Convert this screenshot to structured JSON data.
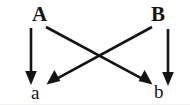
{
  "diagram": {
    "type": "directed-graph",
    "background_color": "#ffffff",
    "stroke_color": "#141414",
    "nodes": [
      {
        "id": "A",
        "label": "A",
        "case": "upper",
        "x": 38,
        "y": 14
      },
      {
        "id": "B",
        "label": "B",
        "case": "upper",
        "x": 157,
        "y": 14
      },
      {
        "id": "a",
        "label": "a",
        "case": "lower",
        "x": 37,
        "y": 92
      },
      {
        "id": "b",
        "label": "b",
        "case": "lower",
        "x": 159,
        "y": 92
      }
    ],
    "edges": [
      {
        "id": "A-a",
        "from": "A",
        "to": "a",
        "kind": "vertical",
        "x1": 31,
        "y1": 28,
        "x2": 31,
        "y2": 84
      },
      {
        "id": "B-b",
        "from": "B",
        "to": "b",
        "kind": "vertical",
        "x1": 168,
        "y1": 29,
        "x2": 168,
        "y2": 85
      },
      {
        "id": "A-b",
        "from": "A",
        "to": "b",
        "kind": "diagonal",
        "x1": 46,
        "y1": 27,
        "x2": 152,
        "y2": 84
      },
      {
        "id": "B-a",
        "from": "B",
        "to": "a",
        "kind": "diagonal",
        "x1": 152,
        "y1": 27,
        "x2": 47,
        "y2": 84
      }
    ],
    "crossing_point": {
      "x": 99,
      "y": 57
    },
    "arrowhead": {
      "style": "filled-triangle",
      "width": 9,
      "length": 11
    }
  }
}
